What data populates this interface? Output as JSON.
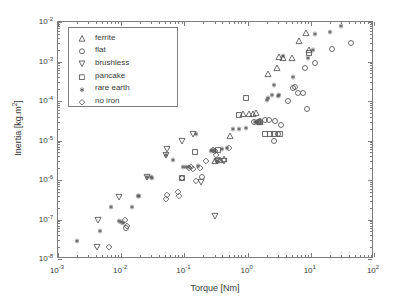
{
  "chart_data": {
    "type": "scatter",
    "title": "",
    "xlabel": "Torque [Nm]",
    "ylabel": "Inertia [kg.m2]",
    "ylabel_display": "Inertia [kg.m²]",
    "xscale": "log",
    "yscale": "log",
    "xlim": [
      0.001,
      100
    ],
    "ylim": [
      1e-08,
      0.01
    ],
    "grid": false,
    "legend_position": "upper left",
    "xticks": [
      {
        "value": 0.001,
        "label": "10-3",
        "mantissa": "10",
        "exponent": "-3"
      },
      {
        "value": 0.01,
        "label": "10-2",
        "mantissa": "10",
        "exponent": "-2"
      },
      {
        "value": 0.1,
        "label": "10-1",
        "mantissa": "10",
        "exponent": "-1"
      },
      {
        "value": 1,
        "label": "100",
        "mantissa": "10",
        "exponent": "0"
      },
      {
        "value": 10,
        "label": "101",
        "mantissa": "10",
        "exponent": "1"
      },
      {
        "value": 100,
        "label": "102",
        "mantissa": "10",
        "exponent": "2"
      }
    ],
    "yticks": [
      {
        "value": 1e-08,
        "label": "10-8",
        "mantissa": "10",
        "exponent": "-8"
      },
      {
        "value": 1e-07,
        "label": "10-7",
        "mantissa": "10",
        "exponent": "-7"
      },
      {
        "value": 1e-06,
        "label": "10-6",
        "mantissa": "10",
        "exponent": "-6"
      },
      {
        "value": 1e-05,
        "label": "10-5",
        "mantissa": "10",
        "exponent": "-5"
      },
      {
        "value": 0.0001,
        "label": "10-4",
        "mantissa": "10",
        "exponent": "-4"
      },
      {
        "value": 0.001,
        "label": "10-3",
        "mantissa": "10",
        "exponent": "-3"
      },
      {
        "value": 0.01,
        "label": "10-2",
        "mantissa": "10",
        "exponent": "-2"
      }
    ],
    "legend": [
      {
        "name": "ferrite",
        "marker": "triangle-up"
      },
      {
        "name": "flat",
        "marker": "circle"
      },
      {
        "name": "brushless",
        "marker": "triangle-down"
      },
      {
        "name": "pancake",
        "marker": "square"
      },
      {
        "name": "rare earth",
        "marker": "star"
      },
      {
        "name": "no iron",
        "marker": "diamond"
      }
    ],
    "marker_color": "#595959",
    "series": [
      {
        "name": "ferrite",
        "marker": "triangle-up",
        "points": [
          [
            0.3,
            3.1e-06
          ],
          [
            0.37,
            3.2e-06
          ],
          [
            0.42,
            3.4e-06
          ],
          [
            0.52,
            1.3e-05
          ],
          [
            0.85,
            4.6e-05
          ],
          [
            1.05,
            4.6e-05
          ],
          [
            1.2,
            4.8e-05
          ],
          [
            1.35,
            5e-05
          ],
          [
            1.55,
            3e-05
          ],
          [
            2.1,
            0.00048
          ],
          [
            2.9,
            0.0007
          ],
          [
            3.1,
            0.0013
          ],
          [
            3.6,
            0.00125
          ],
          [
            5.0,
            0.0012
          ],
          [
            6.5,
            0.0033
          ],
          [
            8.5,
            0.0052
          ],
          [
            9.5,
            0.002
          ]
        ]
      },
      {
        "name": "flat",
        "marker": "circle",
        "points": [
          [
            0.012,
            6e-08
          ],
          [
            0.19,
            1.2e-06
          ],
          [
            1.25,
            3e-05
          ],
          [
            1.45,
            3e-05
          ],
          [
            1.55,
            3.1e-05
          ],
          [
            1.9,
            3.4e-05
          ],
          [
            2.2,
            3.4e-05
          ],
          [
            2.6,
            1e-05
          ],
          [
            2.7,
            3.2e-05
          ],
          [
            3.0,
            1.45e-05
          ],
          [
            3.4,
            2.5e-05
          ],
          [
            4.3,
            0.0001
          ],
          [
            5.2,
            0.00021
          ],
          [
            5.6,
            0.00022
          ],
          [
            6.3,
            0.00016
          ],
          [
            7.6,
            0.00016
          ],
          [
            8.2,
            0.0007
          ],
          [
            8.8,
            6.4e-05
          ],
          [
            11.5,
            0.0009
          ],
          [
            22.0,
            0.0021
          ],
          [
            44.0,
            0.003
          ]
        ]
      },
      {
        "name": "brushless",
        "marker": "triangle-down",
        "points": [
          [
            0.0042,
            2e-08
          ],
          [
            0.0043,
            9.5e-08
          ],
          [
            0.0092,
            3.8e-07
          ],
          [
            0.026,
            1.2e-06
          ],
          [
            0.052,
            4.2e-06
          ],
          [
            0.053,
            6e-06
          ],
          [
            0.09,
            1e-05
          ],
          [
            0.135,
            1.5e-05
          ],
          [
            0.185,
            9e-07
          ],
          [
            0.3,
            1.2e-07
          ],
          [
            0.33,
            3e-06
          ],
          [
            0.42,
            3.1e-06
          ]
        ]
      },
      {
        "name": "pancake",
        "marker": "square",
        "points": [
          [
            0.092,
            1.15e-06
          ],
          [
            0.145,
            5.2e-06
          ],
          [
            0.34,
            5.8e-06
          ],
          [
            0.73,
            4.5e-05
          ],
          [
            0.95,
            0.00012
          ],
          [
            1.9,
            1.45e-05
          ],
          [
            2.3,
            1.5e-05
          ],
          [
            2.6,
            1.5e-05
          ],
          [
            3.2,
            1.45e-05
          ],
          [
            9.2,
            0.0016
          ]
        ]
      },
      {
        "name": "rare earth",
        "marker": "star",
        "points": [
          [
            0.002,
            2.8e-08
          ],
          [
            0.0046,
            5.2e-08
          ],
          [
            0.007,
            2.1e-07
          ],
          [
            0.0091,
            9e-08
          ],
          [
            0.01,
            8.6e-08
          ],
          [
            0.0105,
            8e-08
          ],
          [
            0.015,
            2.1e-07
          ],
          [
            0.0185,
            3.9e-07
          ],
          [
            0.019,
            3.9e-07
          ],
          [
            0.026,
            1.2e-06
          ],
          [
            0.03,
            1.2e-06
          ],
          [
            0.031,
            1.15e-06
          ],
          [
            0.052,
            4.4e-06
          ],
          [
            0.066,
            3.3e-06
          ],
          [
            0.094,
            2.1e-06
          ],
          [
            0.105,
            2.1e-06
          ],
          [
            0.12,
            2.1e-06
          ],
          [
            0.155,
            1.5e-05
          ],
          [
            0.165,
            2.3e-06
          ],
          [
            0.26,
            5.5e-06
          ],
          [
            0.28,
            5.6e-06
          ],
          [
            0.3,
            5.4e-06
          ],
          [
            0.33,
            3e-06
          ],
          [
            0.4,
            6.2e-06
          ],
          [
            0.47,
            6.5e-06
          ],
          [
            0.58,
            1.9e-05
          ],
          [
            0.72,
            2e-05
          ],
          [
            0.95,
            2.1e-05
          ],
          [
            1.3,
            3e-05
          ],
          [
            1.45,
            3e-05
          ],
          [
            2.0,
            0.000105
          ],
          [
            2.1,
            0.00012
          ],
          [
            2.4,
            0.00014
          ],
          [
            2.6,
            0.00025
          ],
          [
            3.0,
            0.000135
          ],
          [
            3.1,
            0.00014
          ],
          [
            3.6,
            0.0014
          ],
          [
            5.2,
            0.0004
          ],
          [
            9.0,
            0.00125
          ],
          [
            11.0,
            0.0019
          ],
          [
            11.5,
            0.005
          ],
          [
            20.0,
            0.0055
          ],
          [
            30.0,
            0.008
          ]
        ]
      },
      {
        "name": "no iron",
        "marker": "diamond",
        "points": [
          [
            0.0065,
            2e-08
          ],
          [
            0.0115,
            9.5e-08
          ],
          [
            0.0125,
            7e-08
          ],
          [
            0.052,
            3.4e-07
          ],
          [
            0.054,
            4.1e-07
          ],
          [
            0.08,
            5e-07
          ],
          [
            0.082,
            4e-07
          ],
          [
            0.09,
            1.1e-06
          ],
          [
            0.093,
            1.1e-06
          ],
          [
            0.118,
            2e-06
          ],
          [
            0.125,
            2.1e-06
          ],
          [
            0.135,
            1.9e-06
          ],
          [
            0.15,
            9.5e-07
          ],
          [
            0.175,
            2e-06
          ],
          [
            0.22,
            3e-06
          ],
          [
            0.28,
            5.6e-06
          ],
          [
            0.3,
            5.5e-06
          ],
          [
            0.32,
            4.2e-06
          ],
          [
            0.34,
            3.2e-06
          ],
          [
            0.5,
            6.5e-06
          ],
          [
            1.45,
            3e-05
          ],
          [
            1.55,
            3e-05
          ]
        ]
      }
    ]
  }
}
